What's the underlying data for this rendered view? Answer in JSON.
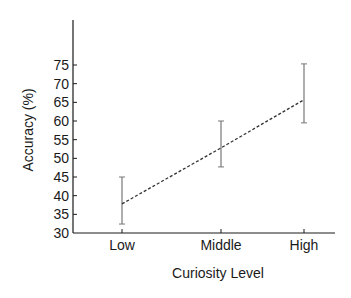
{
  "chart_data": {
    "type": "line",
    "title": "",
    "xlabel": "Curiosity Level",
    "ylabel": "Accuracy (%)",
    "categories": [
      "Low",
      "Middle",
      "High"
    ],
    "series": [
      {
        "name": "Accuracy",
        "values": [
          37.8,
          52.8,
          65.7
        ],
        "error_low": [
          32.4,
          47.7,
          59.5
        ],
        "error_high": [
          45.0,
          60.0,
          75.3
        ],
        "line_style": "dashed"
      }
    ],
    "yticks": [
      30,
      35,
      40,
      45,
      50,
      55,
      60,
      65,
      70,
      75
    ],
    "ylim": [
      30,
      87
    ],
    "grid": false,
    "legend": "none"
  },
  "colors": {
    "axis": "#1a1a1a",
    "line": "#333333",
    "errorbar": "#777777"
  }
}
